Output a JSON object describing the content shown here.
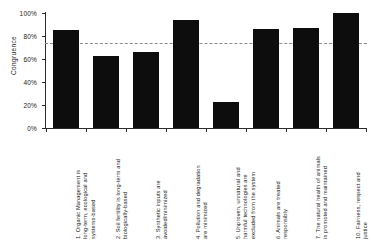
{
  "chart_data": {
    "type": "bar",
    "title": "",
    "subtitle": "",
    "xlabel": "",
    "ylabel": "Congruence",
    "ylim": [
      0,
      100
    ],
    "yticks": [
      "0%",
      "20%",
      "40%",
      "60%",
      "80%",
      "100%"
    ],
    "ytick_values": [
      0,
      20,
      40,
      60,
      80,
      100
    ],
    "grid": false,
    "legend": null,
    "bar_color": "#0d0d0d",
    "background": "#ffffff",
    "reference_line": {
      "value": 74,
      "style": "dashed",
      "color": "#8c8c8c",
      "label": ""
    },
    "categories": [
      "1. Organic Management is long-term, ecological and systems-based",
      "2. Soil fertility is long-term and biologically-based",
      "3. Synthetic inputs are avoided/minimized",
      "4. Pollution and degradation are minimized",
      "5. Unproven, unnatural and harmful technologies are excluded from the system",
      "6. Animals are treated responsibly",
      "7. The natural health of animals is promoted and maintained",
      "10. Fairness, respect and justice"
    ],
    "category_lines": [
      [
        "1. Organic Management is",
        "long-term, ecological and",
        "systems-based"
      ],
      [
        "2. Soil fertility is long-term and",
        "biologically-based"
      ],
      [
        "3. Synthetic inputs are",
        "avoided/minimized"
      ],
      [
        "4. Pollution and degradation",
        "are minimized"
      ],
      [
        "5. Unproven, unnatural and",
        "harmful technologies are",
        "excluded from the system"
      ],
      [
        "6. Animals are treated",
        "responsibly"
      ],
      [
        "7. The natural health of animals",
        "is promoted and maintained"
      ],
      [
        "10. Fairness, respect and",
        "justice"
      ]
    ],
    "values": [
      85,
      63,
      66,
      94,
      23,
      86,
      87,
      100
    ]
  }
}
